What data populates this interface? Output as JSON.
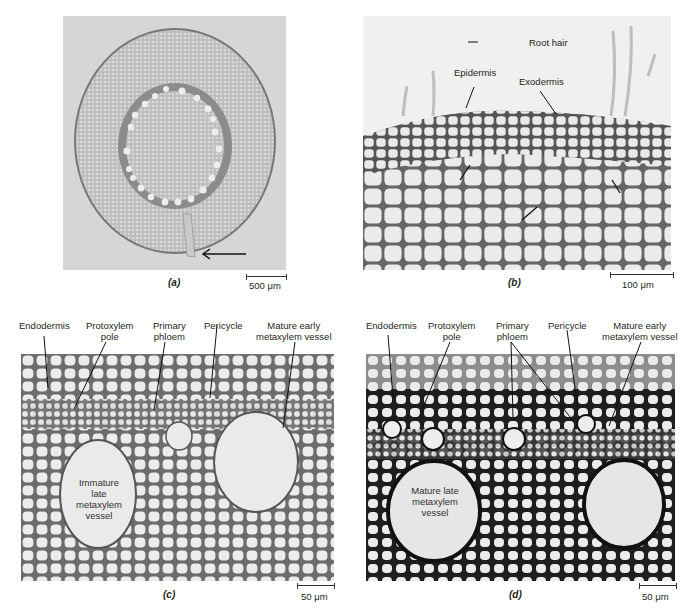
{
  "figure": {
    "panels": [
      {
        "id": "a",
        "letter": "(a)",
        "scale_bar": "500 μm",
        "description": "Root cross-section, low magnification, arrow pointing to lateral root emergence",
        "labels": []
      },
      {
        "id": "b",
        "letter": "(b)",
        "scale_bar": "100 μm",
        "labels": [
          {
            "text": "Root hair"
          },
          {
            "text": "Epidermis"
          },
          {
            "text": "Exodermis"
          }
        ]
      },
      {
        "id": "c",
        "letter": "(c)",
        "scale_bar": "50 μm",
        "labels": [
          {
            "text": "Endodermis"
          },
          {
            "text": "Protoxylem\npole",
            "line1": "Protoxylem",
            "line2": "pole"
          },
          {
            "text": "Primary\nphloem",
            "line1": "Primary",
            "line2": "phloem"
          },
          {
            "text": "Pericycle"
          },
          {
            "text": "Mature early\nmetaxylem vessel",
            "line1": "Mature early",
            "line2": "metaxylem vessel"
          }
        ],
        "inner_label": {
          "line1": "Immature",
          "line2": "late",
          "line3": "metaxylem",
          "line4": "vessel"
        }
      },
      {
        "id": "d",
        "letter": "(d)",
        "scale_bar": "50 μm",
        "labels": [
          {
            "text": "Endodermis"
          },
          {
            "text": "Protoxylem\npole",
            "line1": "Protoxylem",
            "line2": "pole"
          },
          {
            "text": "Primary\nphloem",
            "line1": "Primary",
            "line2": "phloem"
          },
          {
            "text": "Pericycle"
          },
          {
            "text": "Mature early\nmetaxylem vessel",
            "line1": "Mature early",
            "line2": "metaxylem vessel"
          }
        ],
        "inner_label": {
          "line1": "Mature late",
          "line2": "metaxylem",
          "line3": "vessel"
        }
      }
    ]
  }
}
